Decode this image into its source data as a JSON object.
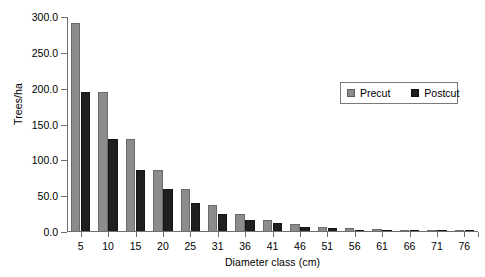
{
  "chart_data": {
    "type": "bar",
    "title": "",
    "xlabel": "Diameter class (cm)",
    "ylabel": "Trees/ha",
    "categories": [
      "5",
      "10",
      "15",
      "20",
      "25",
      "31",
      "36",
      "41",
      "46",
      "51",
      "56",
      "61",
      "66",
      "71",
      "76"
    ],
    "series": [
      {
        "name": "Precut",
        "color": "#8c8c8c",
        "values": [
          292,
          195,
          130,
          87,
          60,
          37,
          25,
          17,
          11,
          7,
          5,
          4,
          2.5,
          1.5,
          1
        ]
      },
      {
        "name": "Postcut",
        "color": "#1f1f1f",
        "values": [
          195,
          130,
          87,
          60,
          41,
          25,
          17,
          13,
          7,
          5,
          3.5,
          2.5,
          1.5,
          1,
          0.7
        ]
      }
    ],
    "ylim": [
      0,
      300
    ],
    "yticks": [
      0,
      50,
      100,
      150,
      200,
      250,
      300
    ],
    "ytick_labels": [
      "0.0",
      "50.0",
      "100.0",
      "150.0",
      "200.0",
      "250.0",
      "300.0"
    ],
    "grid": false,
    "legend_position": "top-right",
    "legend_entries": [
      "Precut",
      "Postcut"
    ]
  }
}
